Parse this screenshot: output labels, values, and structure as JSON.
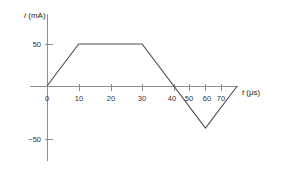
{
  "figure": {
    "background_color": "#ffffff",
    "axis_color": "#8e8e8e",
    "trace_color": "#4a4a4a",
    "text_color": "#333333"
  },
  "labels": {
    "y_axis_title_var": "i",
    "y_axis_title_unit": "(mA)",
    "x_axis_title_var": "t",
    "x_axis_title_unit": "(μs)"
  },
  "chart_data": {
    "type": "line",
    "title": "",
    "xlabel": "t (μs)",
    "ylabel": "i (mA)",
    "xlim": [
      -5,
      78
    ],
    "ylim": [
      -75,
      75
    ],
    "grid": false,
    "legend": null,
    "xticks": [
      0,
      10,
      20,
      30,
      40,
      50,
      60,
      70
    ],
    "xticklabels": [
      "0",
      "10",
      "20",
      "30",
      "40",
      "50",
      "60",
      "70"
    ],
    "yticks": [
      50,
      -50
    ],
    "yticklabels": [
      "50",
      "−50"
    ],
    "series": [
      {
        "name": "i(t)",
        "x": [
          0,
          10,
          30,
          50,
          60
        ],
        "y": [
          0,
          50,
          50,
          -50,
          0
        ]
      }
    ],
    "vertices": [
      {
        "t": 0,
        "i": 0,
        "label": "origin"
      },
      {
        "t": 10,
        "i": 50,
        "label": "rise-to-peak"
      },
      {
        "t": 30,
        "i": 50,
        "label": "end-of-plateau"
      },
      {
        "t": 50,
        "i": -50,
        "label": "negative-peak"
      },
      {
        "t": 60,
        "i": 0,
        "label": "return-to-zero"
      }
    ]
  }
}
